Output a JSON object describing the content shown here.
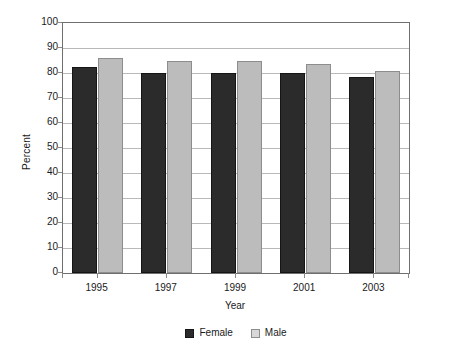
{
  "chart_data": {
    "type": "bar",
    "title": "",
    "xlabel": "Year",
    "ylabel": "Percent",
    "categories": [
      "1995",
      "1997",
      "1999",
      "2001",
      "2003"
    ],
    "series": [
      {
        "name": "Female",
        "color": "#2b2b2b",
        "values": [
          82.5,
          80,
          80,
          80,
          78.5
        ]
      },
      {
        "name": "Male",
        "color": "#bcbcbc",
        "values": [
          86,
          85,
          85,
          83.5,
          81
        ]
      }
    ],
    "ylim": [
      0,
      100
    ],
    "ytick_values": [
      0,
      10,
      20,
      30,
      40,
      50,
      60,
      70,
      80,
      90,
      100
    ],
    "ytick_labels": [
      "0",
      "10",
      "20",
      "30",
      "40",
      "50",
      "60",
      "70",
      "80",
      "90",
      "100"
    ],
    "grid": "horizontal",
    "legend_position": "bottom",
    "legend_entries": [
      "Female",
      "Male"
    ]
  }
}
